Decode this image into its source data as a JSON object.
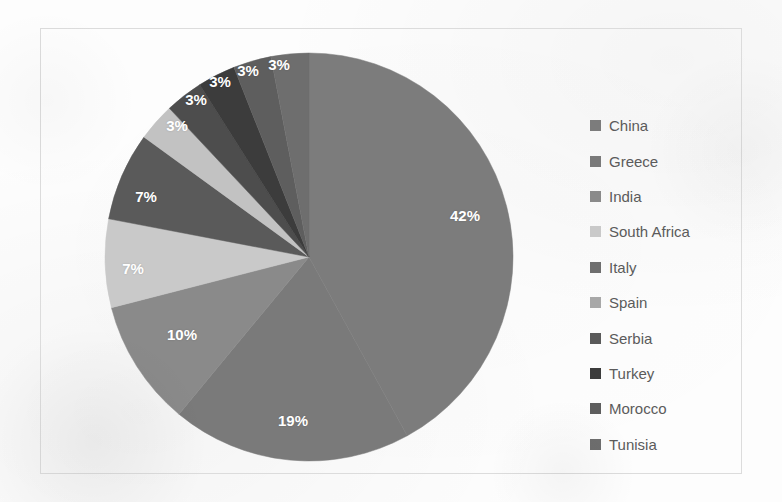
{
  "figure": {
    "background_color": "#fdfdfd",
    "frame_border_color": "#dcdcdc"
  },
  "chart_data": {
    "type": "pie",
    "title": "",
    "subtitle": "",
    "xlabel": "",
    "ylabel": "",
    "grid": false,
    "legend_position": "right",
    "label_format": "percent",
    "label_text_color": "#ffffff",
    "start_angle_deg": 0,
    "direction": "clockwise",
    "categories": [
      "China",
      "Greece",
      "India",
      "South Africa",
      "Spain",
      "Serbia",
      "Turkey",
      "Morocco",
      "Tunisia",
      "Italy"
    ],
    "slices": [
      {
        "label": "China",
        "value": 42,
        "display": "42%",
        "color": "#7c7c7c",
        "label_x": 465,
        "label_y": 215
      },
      {
        "label": "Greece",
        "value": 19,
        "display": "19%",
        "color": "#7a7a7a",
        "label_x": 293,
        "label_y": 420
      },
      {
        "label": "India",
        "value": 10,
        "display": "10%",
        "color": "#8a8a8a",
        "label_x": 182,
        "label_y": 334
      },
      {
        "label": "South Africa",
        "value": 7,
        "display": "7%",
        "color": "#c9c9c9",
        "label_x": 133,
        "label_y": 268
      },
      {
        "label": "Spain",
        "value": 7,
        "display": "7%",
        "color": "#5a5a5a",
        "label_x": 146,
        "label_y": 196
      },
      {
        "label": "Serbia",
        "value": 3,
        "display": "3%",
        "color": "#c2c2c2",
        "label_x": 177,
        "label_y": 125
      },
      {
        "label": "Turkey",
        "value": 3,
        "display": "3%",
        "color": "#4d4d4d",
        "label_x": 196,
        "label_y": 99
      },
      {
        "label": "Morocco",
        "value": 3,
        "display": "3%",
        "color": "#3c3c3c",
        "label_x": 220,
        "label_y": 81
      },
      {
        "label": "Tunisia",
        "value": 3,
        "display": "3%",
        "color": "#5e5e5e",
        "label_x": 248,
        "label_y": 70
      },
      {
        "label": "Italy",
        "value": 3,
        "display": "3%",
        "color": "#6e6e6e",
        "label_x": 279,
        "label_y": 64
      }
    ],
    "values": [
      42,
      19,
      10,
      7,
      7,
      3,
      3,
      3,
      3,
      3
    ],
    "total": 100,
    "units": "percent"
  },
  "legend": {
    "items": [
      {
        "label": "China",
        "color": "#7c7c7c"
      },
      {
        "label": "Greece",
        "color": "#7a7a7a"
      },
      {
        "label": "India",
        "color": "#8a8a8a"
      },
      {
        "label": "South Africa",
        "color": "#c9c9c9"
      },
      {
        "label": "Italy",
        "color": "#6e6e6e"
      },
      {
        "label": "Spain",
        "color": "#a8a8a8"
      },
      {
        "label": "Serbia",
        "color": "#5a5a5a"
      },
      {
        "label": "Turkey",
        "color": "#3c3c3c"
      },
      {
        "label": "Morocco",
        "color": "#5e5e5e"
      },
      {
        "label": "Tunisia",
        "color": "#6e6e6e"
      }
    ]
  }
}
